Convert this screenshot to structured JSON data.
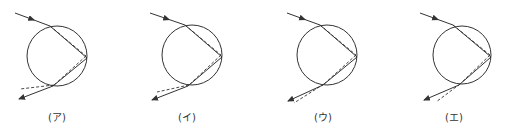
{
  "figure": {
    "stroke_color": "#333333",
    "panels": [
      {
        "label": "(ア)",
        "circle": {
          "cx": 57,
          "cy": 56,
          "r": 30
        },
        "incoming": {
          "from": [
            15,
            13
          ],
          "to": [
            50,
            26
          ]
        },
        "entry": [
          50,
          26
        ],
        "vertex_solid": [
          87,
          58
        ],
        "vertex_dashed": [
          86,
          56
        ],
        "exit_solid": [
          53,
          86
        ],
        "exit_dashed": [
          54,
          85
        ],
        "out_solid": [
          19,
          99
        ],
        "out_dashed": [
          20,
          89
        ],
        "label_pos": [
          57,
          117
        ]
      },
      {
        "label": "(イ)",
        "circle": {
          "cx": 192,
          "cy": 55,
          "r": 30
        },
        "incoming": {
          "from": [
            150,
            13
          ],
          "to": [
            185,
            25
          ]
        },
        "entry": [
          185,
          25
        ],
        "vertex_solid": [
          222,
          57
        ],
        "vertex_dashed": [
          221,
          55
        ],
        "exit_solid": [
          188,
          86
        ],
        "exit_dashed": [
          189,
          85
        ],
        "out_solid": [
          152,
          100
        ],
        "out_dashed": [
          157,
          92
        ],
        "label_pos": [
          187,
          117
        ]
      },
      {
        "label": "(ウ)",
        "circle": {
          "cx": 327,
          "cy": 55,
          "r": 30
        },
        "incoming": {
          "from": [
            287,
            13
          ],
          "to": [
            320,
            25
          ]
        },
        "entry": [
          320,
          25
        ],
        "vertex_solid": [
          357,
          57
        ],
        "vertex_dashed": [
          356,
          55
        ],
        "exit_solid": [
          323,
          85
        ],
        "exit_dashed": [
          324,
          84
        ],
        "out_solid": [
          288,
          101
        ],
        "out_dashed": [
          294,
          103
        ],
        "label_pos": [
          323,
          117
        ]
      },
      {
        "label": "(エ)",
        "circle": {
          "cx": 462,
          "cy": 55,
          "r": 29
        },
        "incoming": {
          "from": [
            420,
            13
          ],
          "to": [
            453,
            25
          ]
        },
        "entry": [
          453,
          25
        ],
        "vertex_solid": [
          491,
          57
        ],
        "vertex_dashed": [
          490,
          55
        ],
        "exit_solid": [
          459,
          85
        ],
        "exit_dashed": [
          460,
          84
        ],
        "out_solid": [
          424,
          100
        ],
        "out_dashed": [
          436,
          102
        ],
        "label_pos": [
          454,
          117
        ]
      }
    ]
  }
}
